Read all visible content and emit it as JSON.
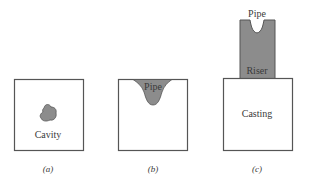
{
  "figure": {
    "panels": [
      {
        "id": "a",
        "caption": "(a)",
        "labels": {
          "cavity": "Cavity"
        }
      },
      {
        "id": "b",
        "caption": "(b)",
        "labels": {
          "pipe": "Pipe"
        }
      },
      {
        "id": "c",
        "caption": "(c)",
        "labels": {
          "pipe": "Pipe",
          "riser": "Riser",
          "casting": "Casting"
        }
      }
    ],
    "colors": {
      "outline": "#555555",
      "shaded_fill": "#8c8c8c",
      "background": "#ffffff",
      "text": "#3a3a3a"
    }
  }
}
